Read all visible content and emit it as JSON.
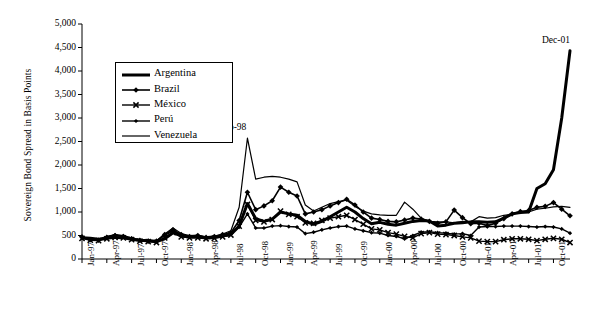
{
  "chart_data": {
    "type": "line",
    "title": "",
    "xlabel": "",
    "ylabel": "Sovereign Bond Spread in Basis Points",
    "ylim": [
      0,
      5000
    ],
    "ytick_values": [
      0,
      500,
      1000,
      1500,
      2000,
      2500,
      3000,
      3500,
      4000,
      4500,
      5000
    ],
    "ytick_labels": [
      "0",
      "500",
      "1,000",
      "1,500",
      "2,000",
      "2,500",
      "3,000",
      "3,500",
      "4,000",
      "4,500",
      "5,000"
    ],
    "grid": false,
    "legend_position": "upper-left-inside",
    "x": [
      "Jan-97",
      "Feb-97",
      "Mar-97",
      "Apr-97",
      "May-97",
      "Jun-97",
      "Jul-97",
      "Aug-97",
      "Sep-97",
      "Oct-97",
      "Nov-97",
      "Dec-97",
      "Jan-98",
      "Feb-98",
      "Mar-98",
      "Apr-98",
      "May-98",
      "Jun-98",
      "Jul-98",
      "Aug-98",
      "Sep-98",
      "Oct-98",
      "Nov-98",
      "Dec-98",
      "Jan-99",
      "Feb-99",
      "Mar-99",
      "Apr-99",
      "May-99",
      "Jun-99",
      "Jul-99",
      "Aug-99",
      "Sep-99",
      "Oct-99",
      "Nov-99",
      "Dec-99",
      "Jan-00",
      "Feb-00",
      "Mar-00",
      "Apr-00",
      "May-00",
      "Jun-00",
      "Jul-00",
      "Aug-00",
      "Sep-00",
      "Oct-00",
      "Nov-00",
      "Dec-00",
      "Jan-01",
      "Feb-01",
      "Mar-01",
      "Apr-01",
      "May-01",
      "Jun-01",
      "Jul-01",
      "Aug-01",
      "Sep-01",
      "Oct-01",
      "Nov-01",
      "Dec-01"
    ],
    "xtick_labels": [
      "Jan-97",
      "Apr-97",
      "Jul-97",
      "Oct-97",
      "Jan-98",
      "Apr-98",
      "Jul-98",
      "Oct-98",
      "Jan-99",
      "Apr-99",
      "Jul-99",
      "Oct-99",
      "Jan-00",
      "Apr-00",
      "Jul-00",
      "Oct-00",
      "Jan-01",
      "Apr-01",
      "Jul-01",
      "Oct-01"
    ],
    "xtick_indices": [
      0,
      3,
      6,
      9,
      12,
      15,
      18,
      21,
      24,
      27,
      30,
      33,
      36,
      39,
      42,
      45,
      48,
      51,
      54,
      57
    ],
    "series": [
      {
        "name": "Argentina",
        "marker": "none",
        "width": 3.0,
        "values": [
          450,
          440,
          420,
          440,
          460,
          450,
          420,
          400,
          390,
          370,
          430,
          560,
          490,
          470,
          470,
          450,
          460,
          490,
          520,
          700,
          1180,
          860,
          800,
          850,
          1000,
          960,
          930,
          800,
          740,
          800,
          900,
          1000,
          1100,
          1000,
          860,
          750,
          780,
          740,
          720,
          760,
          800,
          820,
          810,
          700,
          720,
          760,
          770,
          790,
          790,
          780,
          790,
          870,
          960,
          990,
          1000,
          1500,
          1600,
          1900,
          3000,
          4430
        ]
      },
      {
        "name": "Brazil",
        "marker": "diamond",
        "width": 1.6,
        "values": [
          470,
          410,
          400,
          460,
          500,
          480,
          430,
          400,
          380,
          380,
          520,
          620,
          520,
          480,
          500,
          460,
          480,
          520,
          560,
          820,
          1420,
          1050,
          1130,
          1240,
          1530,
          1420,
          1340,
          960,
          1000,
          1050,
          1130,
          1200,
          1270,
          1150,
          1000,
          870,
          840,
          800,
          790,
          830,
          870,
          850,
          800,
          760,
          790,
          1040,
          880,
          750,
          760,
          710,
          760,
          860,
          960,
          1010,
          1030,
          1100,
          1120,
          1200,
          1060,
          920
        ]
      },
      {
        "name": "México",
        "marker": "x",
        "width": 1.4,
        "values": [
          440,
          400,
          390,
          430,
          460,
          450,
          410,
          380,
          370,
          350,
          450,
          560,
          470,
          450,
          450,
          430,
          440,
          470,
          510,
          700,
          1160,
          820,
          790,
          840,
          1020,
          950,
          900,
          770,
          760,
          820,
          870,
          900,
          930,
          840,
          740,
          640,
          620,
          560,
          530,
          480,
          450,
          540,
          560,
          530,
          520,
          500,
          470,
          450,
          380,
          370,
          370,
          410,
          430,
          430,
          420,
          390,
          420,
          440,
          420,
          350
        ]
      },
      {
        "name": "Perú",
        "marker": "dot",
        "width": 1.4,
        "values": [
          460,
          420,
          410,
          470,
          510,
          490,
          440,
          400,
          390,
          380,
          500,
          600,
          500,
          470,
          480,
          450,
          470,
          500,
          540,
          680,
          960,
          660,
          660,
          700,
          710,
          690,
          680,
          540,
          570,
          620,
          660,
          690,
          700,
          640,
          600,
          560,
          550,
          500,
          480,
          430,
          500,
          570,
          580,
          560,
          550,
          530,
          540,
          500,
          680,
          690,
          690,
          700,
          700,
          700,
          690,
          680,
          690,
          680,
          640,
          550
        ]
      },
      {
        "name": "Venezuela",
        "marker": "none",
        "width": 1.2,
        "values": [
          470,
          430,
          420,
          480,
          520,
          500,
          450,
          410,
          400,
          390,
          530,
          660,
          540,
          500,
          510,
          470,
          490,
          530,
          600,
          1100,
          2570,
          1700,
          1740,
          1760,
          1740,
          1700,
          1640,
          1150,
          1020,
          1100,
          1180,
          1220,
          1250,
          1120,
          1020,
          960,
          940,
          930,
          930,
          1210,
          1060,
          870,
          800,
          790,
          790,
          770,
          800,
          790,
          900,
          870,
          880,
          930,
          950,
          990,
          1000,
          1060,
          1080,
          1110,
          1120,
          1100
        ]
      }
    ],
    "annotations": [
      {
        "text": "Sep-98",
        "x_index": 20,
        "value": 2570
      },
      {
        "text": "Dec-01",
        "x_index": 59,
        "value": 4430
      }
    ]
  }
}
